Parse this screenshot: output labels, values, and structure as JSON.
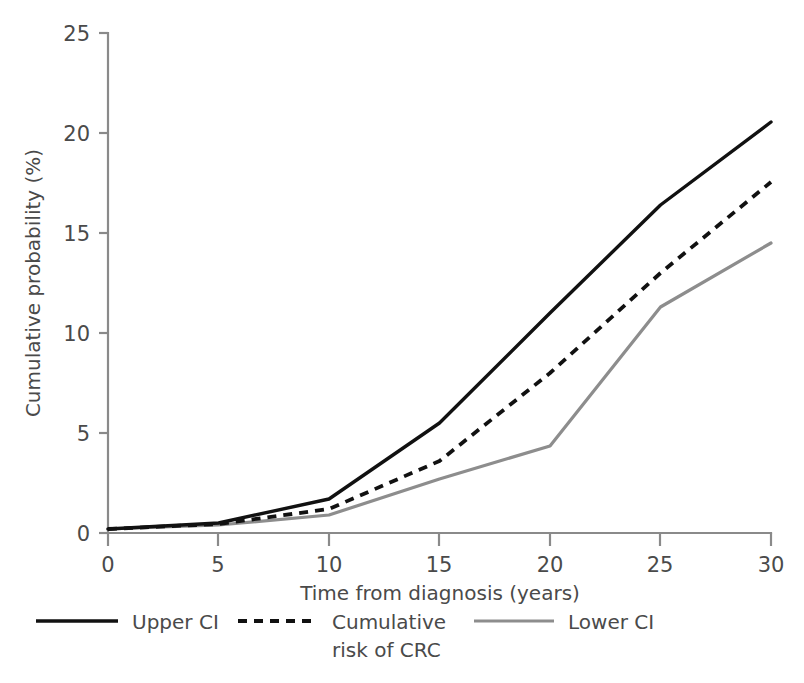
{
  "chart_data": {
    "type": "line",
    "title": "",
    "xlabel": "Time from diagnosis (years)",
    "ylabel": "Cumulative probability (%)",
    "x": [
      0,
      5,
      10,
      15,
      20,
      25,
      30
    ],
    "xlim": [
      0,
      30
    ],
    "ylim": [
      0,
      25
    ],
    "xticks": [
      0,
      5,
      10,
      15,
      20,
      25,
      30
    ],
    "yticks": [
      0,
      5,
      10,
      15,
      20,
      25
    ],
    "xtick_labels": [
      "0",
      "5",
      "10",
      "15",
      "20",
      "25",
      "30"
    ],
    "ytick_labels": [
      "0",
      "5",
      "10",
      "15",
      "20",
      "25"
    ],
    "grid": false,
    "legend_position": "below-left",
    "series": [
      {
        "name": "Upper CI",
        "style": "solid",
        "color": "#111111",
        "values": [
          0.2,
          0.5,
          1.7,
          5.5,
          11.0,
          16.4,
          20.55
        ]
      },
      {
        "name": "Cumulative risk of CRC",
        "style": "dashed",
        "color": "#111111",
        "values": [
          0.2,
          0.45,
          1.2,
          3.6,
          8.0,
          13.0,
          17.55
        ]
      },
      {
        "name": "Lower CI",
        "style": "solid",
        "color": "#8d8d8d",
        "values": [
          0.2,
          0.4,
          0.9,
          2.7,
          4.35,
          11.3,
          14.5
        ]
      }
    ]
  },
  "axes": {
    "y_axis_title": "Cumulative probability (%)",
    "x_axis_title": "Time from diagnosis (years)",
    "y_tick_labels": [
      "25",
      "20",
      "15",
      "10",
      "5",
      "0"
    ],
    "x_tick_labels": [
      "0",
      "5",
      "10",
      "15",
      "20",
      "25",
      "30"
    ]
  },
  "legend": {
    "entries": [
      {
        "label": "Upper CI",
        "label_line2": "",
        "swatch": "solid-black-line"
      },
      {
        "label": "Cumulative",
        "label_line2": "risk of CRC",
        "swatch": "dashed-black-line"
      },
      {
        "label": "Lower CI",
        "label_line2": "",
        "swatch": "solid-grey-line"
      }
    ]
  },
  "colors": {
    "upper_ci": "#111111",
    "cumulative_risk": "#111111",
    "lower_ci": "#8d8d8d",
    "axis": "#8a8a8a",
    "text": "#4a4a4a",
    "background": "#ffffff"
  }
}
